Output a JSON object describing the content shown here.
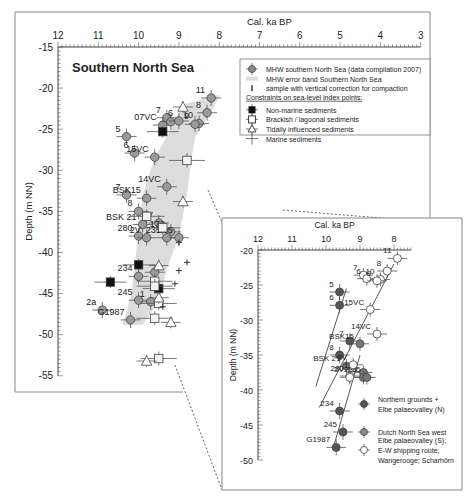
{
  "chart_data": [
    {
      "type": "scatter",
      "title": "Southern North Sea",
      "xlabel": "Cal. ka BP",
      "ylabel": "Depth (m NN)",
      "xlim": [
        12,
        3
      ],
      "ylim": [
        -15,
        -55
      ],
      "xticks": [
        "12",
        "11",
        "10",
        "9",
        "8",
        "7",
        "6",
        "5",
        "4",
        "3"
      ],
      "yticks": [
        "-15",
        "-20",
        "-25",
        "-30",
        "-35",
        "-40",
        "-45",
        "-50",
        "-55"
      ],
      "legend": {
        "items": [
          {
            "label": "MHW southern North Sea (data compilation 2007)",
            "symbol": "grey-circle-errorbar"
          },
          {
            "label": "MHW error band Southern North Sea",
            "symbol": "grey-band"
          },
          {
            "label": "sample with vertical correction for compaction",
            "symbol": "arrow-up"
          }
        ],
        "constraints_heading": "Constraints on sea-level index points:",
        "constraints": [
          {
            "label": "Non-marine sediments",
            "symbol": "black-square"
          },
          {
            "label": "Brackish / lagoonal sediments",
            "symbol": "open-square"
          },
          {
            "label": "Tidally influenced sediments",
            "symbol": "open-triangle"
          },
          {
            "label": "Marine sediments",
            "symbol": "plus"
          }
        ]
      },
      "series": [
        {
          "name": "MHW southern North Sea",
          "points": [
            {
              "label": "11",
              "x": 8.2,
              "y": -21.2
            },
            {
              "label": "8",
              "x": 8.3,
              "y": -23.0
            },
            {
              "label": "7",
              "x": 9.3,
              "y": -23.6
            },
            {
              "label": "07VC",
              "x": 9.4,
              "y": -24.5
            },
            {
              "label": "",
              "x": 9.2,
              "y": -24.1
            },
            {
              "label": "10",
              "x": 8.5,
              "y": -24.3
            },
            {
              "label": "9",
              "x": 8.6,
              "y": -24.4
            },
            {
              "label": "6",
              "x": 9.0,
              "y": -24.0
            },
            {
              "label": "5",
              "x": 10.3,
              "y": -25.9
            },
            {
              "label": "6",
              "x": 10.1,
              "y": -27.9
            },
            {
              "label": "15VC",
              "x": 9.6,
              "y": -28.4
            },
            {
              "label": "14VC",
              "x": 9.3,
              "y": -32.0
            },
            {
              "label": "7",
              "x": 10.3,
              "y": -33.0
            },
            {
              "label": "BSK15",
              "x": 9.8,
              "y": -33.4
            },
            {
              "label": "8",
              "x": 10.0,
              "y": -35.0
            },
            {
              "label": "BSK 21",
              "x": 9.9,
              "y": -36.6
            },
            {
              "label": "3V",
              "x": 9.5,
              "y": -36.4
            },
            {
              "label": "172",
              "x": 9.2,
              "y": -37.5
            },
            {
              "label": "280",
              "x": 10.0,
              "y": -38.0
            },
            {
              "label": "2V",
              "x": 9.8,
              "y": -38.2
            },
            {
              "label": "235",
              "x": 9.3,
              "y": -38.2
            },
            {
              "label": "235",
              "x": 9.0,
              "y": -38.2
            },
            {
              "label": "234",
              "x": 10.0,
              "y": -42.9
            },
            {
              "label": "",
              "x": 9.6,
              "y": -42.4
            },
            {
              "label": "245",
              "x": 10.0,
              "y": -45.8
            },
            {
              "label": "1",
              "x": 9.7,
              "y": -46.0
            },
            {
              "label": "2a",
              "x": 10.9,
              "y": -47.0
            },
            {
              "label": "G1987",
              "x": 10.2,
              "y": -48.2
            }
          ]
        },
        {
          "name": "Non-marine sediments",
          "points": [
            {
              "x": 9.4,
              "y": -25.3
            },
            {
              "x": 10.0,
              "y": -41.5
            },
            {
              "x": 10.7,
              "y": -43.6
            },
            {
              "x": 9.5,
              "y": -44.4
            }
          ]
        },
        {
          "name": "Brackish / lagoonal sediments",
          "points": [
            {
              "x": 8.8,
              "y": -28.8
            },
            {
              "x": 9.8,
              "y": -35.6
            },
            {
              "x": 9.4,
              "y": -37.0
            },
            {
              "x": 9.6,
              "y": -43.5
            },
            {
              "x": 9.6,
              "y": -44.1
            },
            {
              "x": 9.5,
              "y": -46.2
            },
            {
              "x": 9.6,
              "y": -48.0
            },
            {
              "x": 9.5,
              "y": -52.9
            }
          ]
        },
        {
          "name": "Tidally influenced sediments",
          "points": [
            {
              "x": 8.9,
              "y": -22.3
            },
            {
              "x": 8.9,
              "y": -33.8
            },
            {
              "x": 9.5,
              "y": -41.6
            },
            {
              "x": 9.5,
              "y": -45.5
            },
            {
              "x": 9.2,
              "y": -48.5
            },
            {
              "x": 9.8,
              "y": -53.2
            }
          ]
        },
        {
          "name": "Marine sediments",
          "points": [
            {
              "x": 9.0,
              "y": -38.8
            },
            {
              "x": 8.8,
              "y": -41.2
            },
            {
              "x": 9.0,
              "y": -42.2
            },
            {
              "x": 9.1,
              "y": -43.8
            },
            {
              "x": 9.4,
              "y": -46.6
            }
          ]
        }
      ]
    },
    {
      "type": "scatter",
      "title": "",
      "xlabel": "Cal. ka BP",
      "ylabel": "Depth (m NN)",
      "xlim": [
        12,
        7.5
      ],
      "ylim": [
        -20,
        -50
      ],
      "xticks": [
        "12",
        "11",
        "10",
        "9",
        "8"
      ],
      "yticks": [
        "-20",
        "-25",
        "-30",
        "-35",
        "-40",
        "-45",
        "-50"
      ],
      "legend": {
        "items": [
          {
            "label": "Northern grounds + Elbe palaeovalley (N)",
            "symbol": "dark-grey-circle"
          },
          {
            "label": "Dutch North Sea west",
            "symbol": "grey-circle"
          },
          {
            "label": "Elbe palaeovalley (S); E-W shipping route; Wangerooge; Scharhörn",
            "symbol": "open-circle"
          }
        ]
      },
      "series": [
        {
          "name": "Northern grounds + Elbe palaeovalley (N)",
          "points": [
            {
              "label": "5",
              "x": 9.6,
              "y": -26.0
            },
            {
              "label": "6",
              "x": 9.6,
              "y": -27.9
            },
            {
              "label": "7",
              "x": 9.3,
              "y": -33.0
            },
            {
              "label": "8",
              "x": 9.6,
              "y": -35.0
            },
            {
              "label": "234",
              "x": 9.6,
              "y": -43.0
            },
            {
              "label": "245",
              "x": 9.5,
              "y": -46.0
            },
            {
              "label": "G1987",
              "x": 9.7,
              "y": -48.2
            }
          ]
        },
        {
          "name": "Dutch North Sea west",
          "points": [
            {
              "label": "BSK15",
              "x": 9.0,
              "y": -33.4
            },
            {
              "label": "BSK 21",
              "x": 9.4,
              "y": -36.6
            },
            {
              "label": "172",
              "x": 8.9,
              "y": -37.5
            },
            {
              "label": "235",
              "x": 8.9,
              "y": -38.2
            },
            {
              "label": "235",
              "x": 8.8,
              "y": -38.2
            }
          ]
        },
        {
          "name": "Elbe palaeovalley (S); E-W shipping route; Wangerooge; Scharhörn",
          "points": [
            {
              "label": "11",
              "x": 7.9,
              "y": -21.2
            },
            {
              "label": "8",
              "x": 8.2,
              "y": -23.0
            },
            {
              "label": "7",
              "x": 8.9,
              "y": -23.6
            },
            {
              "label": "6",
              "x": 8.8,
              "y": -24.1
            },
            {
              "label": "10",
              "x": 8.4,
              "y": -24.2
            },
            {
              "label": "9",
              "x": 8.5,
              "y": -24.4
            },
            {
              "label": "15VC",
              "x": 8.7,
              "y": -28.5
            },
            {
              "label": "14VC",
              "x": 8.5,
              "y": -32.0
            },
            {
              "label": "3V",
              "x": 9.2,
              "y": -36.4
            },
            {
              "label": "280",
              "x": 9.3,
              "y": -38.0
            },
            {
              "label": "2V",
              "x": 9.3,
              "y": -38.2
            }
          ]
        }
      ]
    }
  ]
}
